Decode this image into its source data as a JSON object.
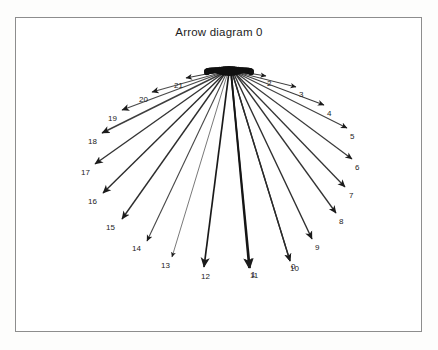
{
  "page": {
    "width": 438,
    "height": 350,
    "background": "#ffffff",
    "frame": {
      "name": "plot-frame",
      "x": 15,
      "y": 17,
      "width": 407,
      "height": 315,
      "stroke": "#8d8d8d",
      "stroke_width": 1
    }
  },
  "title": "Arrow diagram 0",
  "chart_data": {
    "type": "scatter",
    "subtype": "radial-arrow-fan",
    "title": "Arrow diagram 0",
    "xlabel": "",
    "ylabel": "",
    "grid": false,
    "legend": null,
    "origin": {
      "x": 229,
      "y": 73
    },
    "categories": [
      "0",
      "1",
      "2",
      "3",
      "4",
      "5",
      "6",
      "7",
      "8",
      "9",
      "10",
      "11",
      "12",
      "13",
      "14",
      "15",
      "16",
      "17",
      "18",
      "19",
      "20",
      "21"
    ],
    "arrows": [
      {
        "label": "0",
        "x0": 232,
        "y0": 72,
        "x1": 290,
        "y1": 261,
        "color": "#2a2a2a",
        "width": 1.3,
        "label_x": 291,
        "label_y": 263,
        "label_anchor": "start"
      },
      {
        "label": "1",
        "x0": 231,
        "y0": 72,
        "x1": 250,
        "y1": 268,
        "color": "#161616",
        "width": 1.7,
        "label_x": 251,
        "label_y": 271,
        "label_anchor": "start"
      },
      {
        "label": "2",
        "x0": 236,
        "y0": 71,
        "x1": 266,
        "y1": 76,
        "color": "#3a3a3a",
        "width": 1.0,
        "label_x": 267,
        "label_y": 80,
        "label_anchor": "start"
      },
      {
        "label": "3",
        "x0": 236,
        "y0": 72,
        "x1": 296,
        "y1": 87,
        "color": "#3c3c3c",
        "width": 1.0,
        "label_x": 299,
        "label_y": 91,
        "label_anchor": "start"
      },
      {
        "label": "4",
        "x0": 236,
        "y0": 72,
        "x1": 324,
        "y1": 105,
        "color": "#3a3a3a",
        "width": 1.1,
        "label_x": 327,
        "label_y": 110,
        "label_anchor": "start"
      },
      {
        "label": "5",
        "x0": 235,
        "y0": 72,
        "x1": 347,
        "y1": 128,
        "color": "#414141",
        "width": 1.1,
        "label_x": 350,
        "label_y": 133,
        "label_anchor": "start"
      },
      {
        "label": "6",
        "x0": 235,
        "y0": 72,
        "x1": 352,
        "y1": 159,
        "color": "#3a3a3a",
        "width": 1.2,
        "label_x": 355,
        "label_y": 164,
        "label_anchor": "start"
      },
      {
        "label": "7",
        "x0": 234,
        "y0": 72,
        "x1": 345,
        "y1": 187,
        "color": "#343434",
        "width": 1.3,
        "label_x": 349,
        "label_y": 192,
        "label_anchor": "start"
      },
      {
        "label": "8",
        "x0": 234,
        "y0": 72,
        "x1": 336,
        "y1": 213,
        "color": "#333333",
        "width": 1.3,
        "label_x": 339,
        "label_y": 218,
        "label_anchor": "start"
      },
      {
        "label": "9",
        "x0": 233,
        "y0": 72,
        "x1": 312,
        "y1": 239,
        "color": "#2e2e2e",
        "width": 1.4,
        "label_x": 315,
        "label_y": 244,
        "label_anchor": "start"
      },
      {
        "label": "10",
        "x0": 232,
        "y0": 72,
        "x1": 290,
        "y1": 261,
        "color": "#2a2a2a",
        "width": 1.3,
        "label_x": 290,
        "label_y": 265,
        "label_anchor": "start"
      },
      {
        "label": "11",
        "x0": 231,
        "y0": 72,
        "x1": 249,
        "y1": 268,
        "color": "#151515",
        "width": 1.8,
        "label_x": 250,
        "label_y": 272,
        "label_anchor": "start"
      },
      {
        "label": "12",
        "x0": 229,
        "y0": 72,
        "x1": 204,
        "y1": 267,
        "color": "#1a1a1a",
        "width": 1.7,
        "label_x": 201,
        "label_y": 273,
        "label_anchor": "start"
      },
      {
        "label": "13",
        "x0": 228,
        "y0": 72,
        "x1": 172,
        "y1": 257,
        "color": "#6a6a6a",
        "width": 0.9,
        "label_x": 161,
        "label_y": 262,
        "label_anchor": "start"
      },
      {
        "label": "14",
        "x0": 227,
        "y0": 72,
        "x1": 147,
        "y1": 241,
        "color": "#474747",
        "width": 1.1,
        "label_x": 132,
        "label_y": 245,
        "label_anchor": "start"
      },
      {
        "label": "15",
        "x0": 226,
        "y0": 72,
        "x1": 122,
        "y1": 219,
        "color": "#2d2d2d",
        "width": 1.4,
        "label_x": 106,
        "label_y": 224,
        "label_anchor": "start"
      },
      {
        "label": "16",
        "x0": 226,
        "y0": 72,
        "x1": 103,
        "y1": 193,
        "color": "#2b2b2b",
        "width": 1.4,
        "label_x": 88,
        "label_y": 198,
        "label_anchor": "start"
      },
      {
        "label": "17",
        "x0": 225,
        "y0": 72,
        "x1": 95,
        "y1": 164,
        "color": "#343434",
        "width": 1.4,
        "label_x": 81,
        "label_y": 169,
        "label_anchor": "start"
      },
      {
        "label": "18",
        "x0": 225,
        "y0": 72,
        "x1": 102,
        "y1": 133,
        "color": "#3e3e3e",
        "width": 1.4,
        "label_x": 88,
        "label_y": 138,
        "label_anchor": "start"
      },
      {
        "label": "19",
        "x0": 224,
        "y0": 72,
        "x1": 122,
        "y1": 110,
        "color": "#4a4a4a",
        "width": 1.3,
        "label_x": 108,
        "label_y": 115,
        "label_anchor": "start"
      },
      {
        "label": "20",
        "x0": 223,
        "y0": 72,
        "x1": 152,
        "y1": 92,
        "color": "#4f4f4f",
        "width": 1.2,
        "label_x": 139,
        "label_y": 96,
        "label_anchor": "start"
      },
      {
        "label": "21",
        "x0": 222,
        "y0": 71,
        "x1": 186,
        "y1": 78,
        "color": "#3c3c3c",
        "width": 1.1,
        "label_x": 174,
        "label_y": 82,
        "label_anchor": "start"
      }
    ],
    "origin_cluster": {
      "description": "overlapping arrowhead/tail ink blob at the common origin",
      "cx": 229,
      "cy": 72,
      "rx": 26,
      "ry": 5,
      "color": "#101010"
    }
  }
}
